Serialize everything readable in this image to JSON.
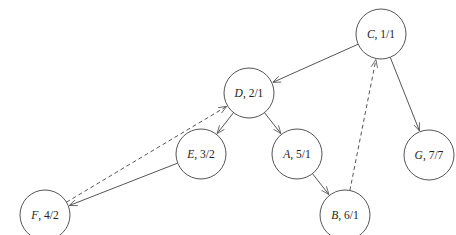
{
  "diagram": {
    "type": "directed-graph",
    "nodes": [
      {
        "id": "C",
        "label_name": "C",
        "label_value": ", 1/1",
        "x": 381,
        "y": 34
      },
      {
        "id": "D",
        "label_name": "D",
        "label_value": ", 2/1",
        "x": 249,
        "y": 93
      },
      {
        "id": "G",
        "label_name": "G",
        "label_value": ", 7/7",
        "x": 429,
        "y": 155
      },
      {
        "id": "E",
        "label_name": "E",
        "label_value": ", 3/2",
        "x": 201,
        "y": 154
      },
      {
        "id": "A",
        "label_name": "A",
        "label_value": ", 5/1",
        "x": 297,
        "y": 154
      },
      {
        "id": "F",
        "label_name": "F",
        "label_value": ", 4/2",
        "x": 45,
        "y": 215
      },
      {
        "id": "B",
        "label_name": "B",
        "label_value": ", 6/1",
        "x": 345,
        "y": 215
      }
    ],
    "edges": [
      {
        "from": "C",
        "to": "D",
        "style": "solid"
      },
      {
        "from": "C",
        "to": "G",
        "style": "solid"
      },
      {
        "from": "D",
        "to": "E",
        "style": "solid"
      },
      {
        "from": "D",
        "to": "A",
        "style": "solid"
      },
      {
        "from": "E",
        "to": "F",
        "style": "solid"
      },
      {
        "from": "A",
        "to": "B",
        "style": "solid"
      },
      {
        "from": "F",
        "to": "D",
        "style": "dashed"
      },
      {
        "from": "B",
        "to": "C",
        "style": "dashed"
      }
    ],
    "node_radius": 25,
    "colors": {
      "stroke": "#555555",
      "text": "#222222",
      "background": "#ffffff"
    }
  }
}
